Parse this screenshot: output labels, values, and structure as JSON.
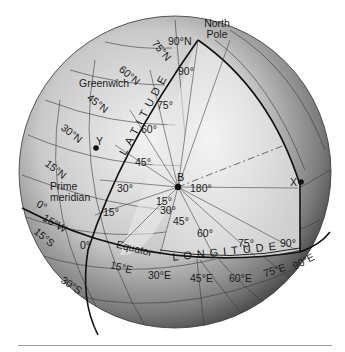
{
  "figure": {
    "labels": {
      "north_pole_line1": "North",
      "north_pole_line2": "Pole",
      "greenwich": "Greenwich",
      "prime_meridian_line1": "Prime",
      "prime_meridian_line2": "meridian",
      "equator": "Equator",
      "latitude_word": "LATITUDE",
      "longitude_word": "LONGITUDE",
      "point_b": "B",
      "point_x": "X",
      "point_y": "Y",
      "angle_180": "180°"
    },
    "latitude_lines": [
      "90°N",
      "75°N",
      "60°N",
      "45°N",
      "30°N",
      "15°N",
      "0°",
      "15°S",
      "30°S"
    ],
    "longitude_lines": [
      "15°W",
      "0°",
      "15°E",
      "30°E",
      "45°E",
      "60°E",
      "75°E",
      "90°E"
    ],
    "latitude_angles": [
      "15°",
      "30°",
      "45°",
      "60°",
      "75°",
      "90°"
    ],
    "longitude_angles": [
      "15°",
      "30°",
      "45°",
      "60°",
      "75°",
      "90°"
    ],
    "colors": {
      "globe_light": "#e6e6e6",
      "globe_dark": "#5a5a5a",
      "cutaway": "#d9d9d9",
      "lines": "#2a2a2a",
      "rule": "#9a9a9a"
    }
  }
}
